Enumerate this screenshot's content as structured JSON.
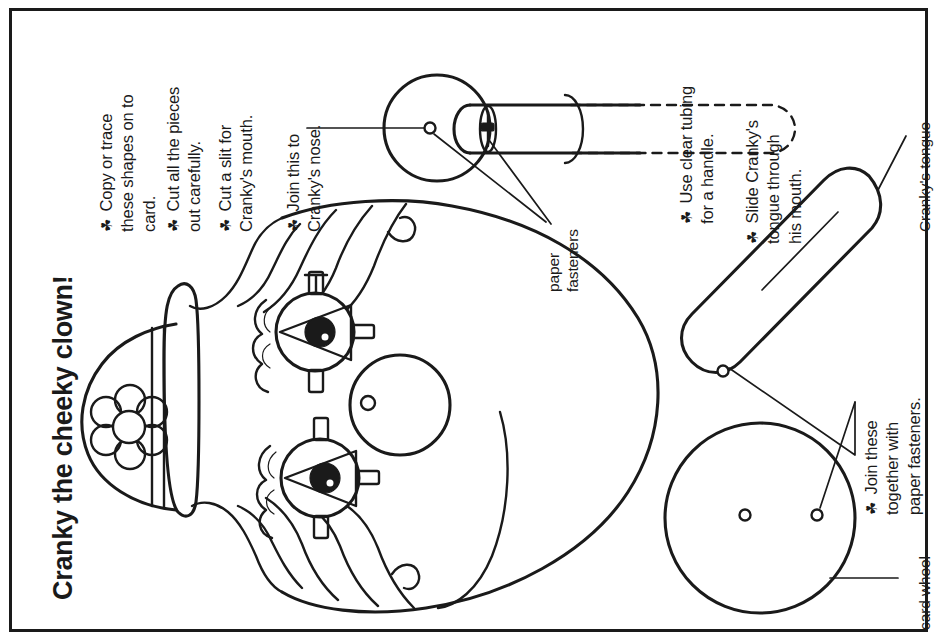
{
  "page": {
    "title": "Cranky the cheeky clown!",
    "bullet_glyph": "☘",
    "ink_color": "#1a1a1a",
    "paper_color": "#ffffff"
  },
  "instructions_left": [
    {
      "text": "Copy or trace\nthese shapes on to\ncard."
    },
    {
      "text": "Cut all the pieces\nout carefully."
    },
    {
      "text": "Cut a slit for\nCranky's mouth."
    },
    {
      "text": "Join this to\nCranky's nose."
    }
  ],
  "instructions_right": [
    {
      "text": "Use clear tubing\nfor a handle."
    },
    {
      "text": "Slide Cranky's\ntongue through\nhis mouth."
    },
    {
      "text": "Join these\ntogether with\npaper fasteners."
    }
  ],
  "callouts": [
    {
      "name": "paper-fasteners",
      "text": "paper\nfasteners"
    },
    {
      "name": "crankys-tongue",
      "text": "Cranky's tongue"
    },
    {
      "name": "card-wheel",
      "text": "card wheel"
    }
  ],
  "artwork": {
    "nose_piece": "clown nose circle with clear tube handle",
    "clown_head": "cranky the clown head with hat, flower, hair, two eyes, nose and mouth slit",
    "tongue_piece": "long rounded tongue strip with fastener hole",
    "wheel_piece": "card wheel circle with centre hole and offset hole"
  }
}
